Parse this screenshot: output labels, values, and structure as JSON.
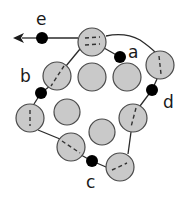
{
  "diagram": {
    "colors": {
      "circle_fill": "#c9c9c9",
      "circle_stroke": "#4a4a4a",
      "path": "#2a2a2a",
      "dot": "#000000"
    },
    "circles": [
      {
        "id": "top",
        "cx": 92,
        "cy": 42,
        "on_path": true
      },
      {
        "id": "upper-left",
        "cx": 57,
        "cy": 76,
        "on_path": true
      },
      {
        "id": "mid-1",
        "cx": 92,
        "cy": 77,
        "on_path": false
      },
      {
        "id": "mid-2",
        "cx": 127,
        "cy": 77,
        "on_path": false
      },
      {
        "id": "upper-right",
        "cx": 160,
        "cy": 65,
        "on_path": true
      },
      {
        "id": "left",
        "cx": 30,
        "cy": 118,
        "on_path": true
      },
      {
        "id": "center",
        "cx": 67,
        "cy": 112,
        "on_path": false
      },
      {
        "id": "right",
        "cx": 133,
        "cy": 118,
        "on_path": true
      },
      {
        "id": "center-low",
        "cx": 102,
        "cy": 132,
        "on_path": false
      },
      {
        "id": "bottom-left",
        "cx": 71,
        "cy": 147,
        "on_path": true
      },
      {
        "id": "bottom-right",
        "cx": 120,
        "cy": 167,
        "on_path": true
      }
    ],
    "points": [
      {
        "label": "a",
        "cx": 120,
        "cy": 57,
        "lx": 130,
        "ly": 55
      },
      {
        "label": "b",
        "cx": 41,
        "cy": 93,
        "lx": 21,
        "ly": 82
      },
      {
        "label": "c",
        "cx": 92,
        "cy": 161,
        "lx": 85,
        "ly": 186
      },
      {
        "label": "d",
        "cx": 152,
        "cy": 90,
        "lx": 163,
        "ly": 108
      },
      {
        "label": "e",
        "cx": 42,
        "cy": 38,
        "lx": 36,
        "ly": 25
      }
    ]
  }
}
